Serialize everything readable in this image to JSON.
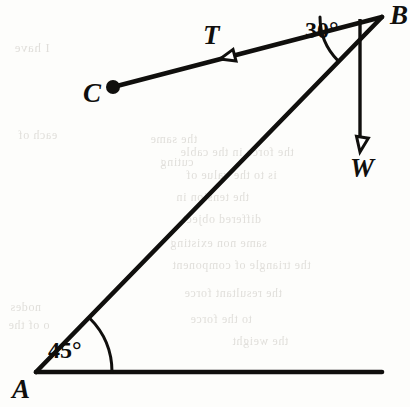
{
  "figure": {
    "type": "statics-free-body-diagram",
    "caption_points": [
      "A",
      "B",
      "C",
      "T",
      "W"
    ],
    "background_color": "#fdfdfb",
    "ink_color": "#100f0d",
    "points": {
      "A": {
        "label": "A",
        "x": 36,
        "y": 372,
        "label_x": 12,
        "label_y": 376,
        "marker": "vertex"
      },
      "B": {
        "label": "B",
        "x": 382,
        "y": 17,
        "label_x": 390,
        "label_y": 2,
        "marker": "vertex"
      },
      "C": {
        "label": "C",
        "x": 113,
        "y": 87,
        "label_x": 83,
        "label_y": 80,
        "marker": "filled-dot",
        "dot_radius": 7
      }
    },
    "segments": [
      {
        "name": "ground-line",
        "from": [
          36,
          372
        ],
        "to": [
          382,
          372
        ],
        "width": 4.6
      },
      {
        "name": "boom-AB",
        "from": [
          36,
          372
        ],
        "to": [
          382,
          17
        ],
        "width": 4.6
      },
      {
        "name": "cable-BC",
        "from": [
          382,
          17
        ],
        "to": [
          113,
          87
        ],
        "width": 4.6
      }
    ],
    "vectors": [
      {
        "name": "tension-T",
        "label": "T",
        "label_x": 203,
        "label_y": 22,
        "from": [
          382,
          17
        ],
        "to": [
          113,
          87
        ],
        "arrow_at": [
          220,
          59
        ],
        "arrow_style": "hollow-triangle",
        "arrow_size": 15
      },
      {
        "name": "weight-W",
        "label": "W",
        "label_x": 350,
        "label_y": 155,
        "from": [
          382,
          17
        ],
        "to": [
          360,
          152
        ],
        "line": {
          "from": [
            360,
            19
          ],
          "to": [
            360,
            136
          ]
        },
        "arrow_at": [
          360,
          152
        ],
        "arrow_style": "hollow-triangle",
        "arrow_size": 15,
        "direction": "down"
      }
    ],
    "angles": [
      {
        "name": "angle-at-A",
        "label": "45°",
        "value": 45,
        "unit": "degrees",
        "vertex": [
          36,
          372
        ],
        "radius": 76,
        "start_deg": 0,
        "end_deg": 45,
        "label_x": 48,
        "label_y": 338
      },
      {
        "name": "angle-at-B",
        "label": "30°",
        "value": 30,
        "unit": "degrees",
        "vertex": [
          382,
          17
        ],
        "radius": 62,
        "start_deg": 180,
        "end_deg": 225,
        "label_x": 305,
        "label_y": 18
      }
    ],
    "ghost_text": [
      {
        "text": "I have",
        "x": 14,
        "y": 40,
        "size": 13
      },
      {
        "text": "each of",
        "x": 18,
        "y": 128,
        "size": 12
      },
      {
        "text": "the same",
        "x": 150,
        "y": 132,
        "size": 12
      },
      {
        "text": "cuting",
        "x": 160,
        "y": 155,
        "size": 12
      },
      {
        "text": "the force in the cable",
        "x": 180,
        "y": 145,
        "size": 12
      },
      {
        "text": "is to the value of",
        "x": 186,
        "y": 168,
        "size": 12
      },
      {
        "text": "the tension in",
        "x": 176,
        "y": 190,
        "size": 12
      },
      {
        "text": "differed object",
        "x": 182,
        "y": 212,
        "size": 12
      },
      {
        "text": "same non existing",
        "x": 170,
        "y": 236,
        "size": 12
      },
      {
        "text": "the triangle of component",
        "x": 172,
        "y": 258,
        "size": 12
      },
      {
        "text": "the resultant force",
        "x": 184,
        "y": 286,
        "size": 12
      },
      {
        "text": "to the force",
        "x": 190,
        "y": 312,
        "size": 12
      },
      {
        "text": "nodes",
        "x": 10,
        "y": 300,
        "size": 12
      },
      {
        "text": "o of the",
        "x": 8,
        "y": 318,
        "size": 12
      },
      {
        "text": "the weight",
        "x": 232,
        "y": 334,
        "size": 12
      }
    ]
  }
}
